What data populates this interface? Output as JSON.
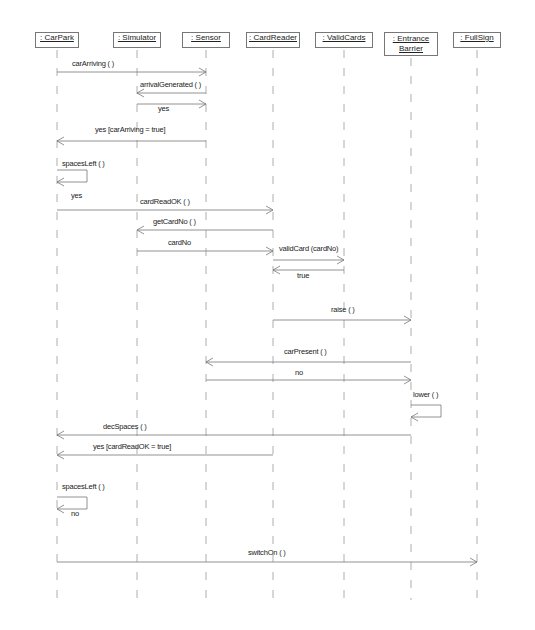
{
  "diagram": {
    "type": "sequence",
    "lifelines": [
      {
        "id": "carpark",
        "label": ": CarPark",
        "x": 57
      },
      {
        "id": "simulator",
        "label": ": Simulator",
        "x": 137
      },
      {
        "id": "sensor",
        "label": ": Sensor",
        "x": 206
      },
      {
        "id": "cardreader",
        "label": ": CardReader",
        "x": 273
      },
      {
        "id": "validcards",
        "label": ": ValidCards",
        "x": 344
      },
      {
        "id": "entrancebarrier",
        "label_line1": ": Entrance",
        "label_line2": "Barrier",
        "x": 411
      },
      {
        "id": "fullsign",
        "label": ": FullSign",
        "x": 477
      }
    ],
    "messages": [
      {
        "label": "carArriving ( )",
        "from": "carpark",
        "to": "sensor",
        "y": 72,
        "kind": "call"
      },
      {
        "label": "arrivalGenerated ( )",
        "from": "sensor",
        "to": "simulator",
        "y": 93,
        "kind": "call"
      },
      {
        "label": "yes",
        "from": "simulator",
        "to": "sensor",
        "y": 104,
        "kind": "return"
      },
      {
        "label": "yes [carArriving = true]",
        "from": "sensor",
        "to": "carpark",
        "y": 141,
        "kind": "return"
      },
      {
        "label": "spacesLeft ( )",
        "from": "carpark",
        "to": "carpark",
        "y": 170,
        "kind": "self"
      },
      {
        "label": "yes",
        "from": "carpark",
        "to": "carpark",
        "y": 195,
        "kind": "return-label"
      },
      {
        "label": "cardReadOK ( )",
        "from": "carpark",
        "to": "cardreader",
        "y": 210,
        "kind": "call"
      },
      {
        "label": "getCardNo ( )",
        "from": "cardreader",
        "to": "simulator",
        "y": 230,
        "kind": "call"
      },
      {
        "label": "cardNo",
        "from": "simulator",
        "to": "cardreader",
        "y": 251,
        "kind": "return"
      },
      {
        "label": "validCard (cardNo)",
        "from": "cardreader",
        "to": "validcards",
        "y": 260,
        "kind": "call"
      },
      {
        "label": "true",
        "from": "validcards",
        "to": "cardreader",
        "y": 270,
        "kind": "return"
      },
      {
        "label": "raise ( )",
        "from": "cardreader",
        "to": "entrancebarrier",
        "y": 320,
        "kind": "call"
      },
      {
        "label": "carPresent ( )",
        "from": "entrancebarrier",
        "to": "sensor",
        "y": 362,
        "kind": "call"
      },
      {
        "label": "no",
        "from": "sensor",
        "to": "entrancebarrier",
        "y": 380,
        "kind": "return"
      },
      {
        "label": "lower ( )",
        "from": "entrancebarrier",
        "to": "entrancebarrier",
        "y": 405,
        "kind": "self"
      },
      {
        "label": "decSpaces ( )",
        "from": "entrancebarrier",
        "to": "carpark",
        "y": 435,
        "kind": "call"
      },
      {
        "label": "yes [cardReadOK = true]",
        "from": "cardreader",
        "to": "carpark",
        "y": 455,
        "kind": "return"
      },
      {
        "label": "spacesLeft ( )",
        "from": "carpark",
        "to": "carpark",
        "y": 497,
        "kind": "self"
      },
      {
        "label": "no",
        "from": "carpark",
        "to": "carpark",
        "y": 512,
        "kind": "return-label"
      },
      {
        "label": "switchOn ( )",
        "from": "carpark",
        "to": "fullsign",
        "y": 562,
        "kind": "call"
      }
    ]
  }
}
